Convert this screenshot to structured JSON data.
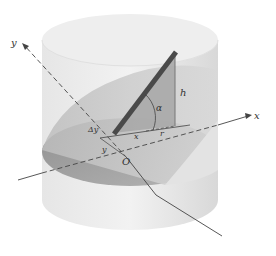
{
  "figure": {
    "labels": {
      "y_axis": "y",
      "x_axis": "x",
      "origin": "O",
      "angle": "α",
      "height": "h",
      "x_segment": "x",
      "radius": "r",
      "delta_y": "Δy",
      "y_segment": "y"
    },
    "colors": {
      "background": "#ffffff",
      "cylinder_light": "#ececec",
      "cylinder_mid": "#d6d6d6",
      "base_dark": "#9a9a9a",
      "wedge": "#c2c2c2",
      "rod": "#555555",
      "axis": "#444444"
    }
  }
}
